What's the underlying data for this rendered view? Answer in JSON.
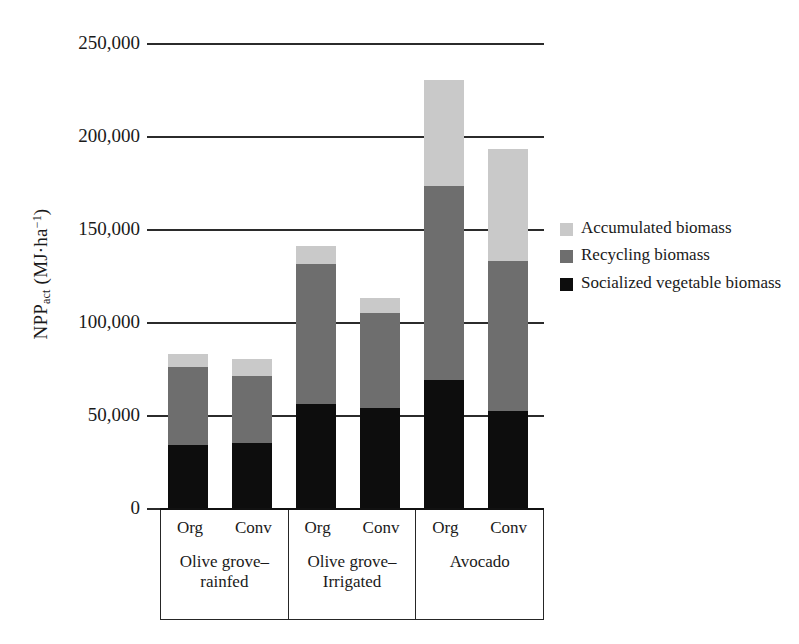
{
  "chart_data": {
    "type": "bar",
    "stacked": true,
    "title": "",
    "xlabel": "",
    "ylabel": "NPPact (MJ·ha-1)",
    "ylabel_parts": {
      "base": "NPP",
      "sub": "act",
      "unit_open": " (MJ·ha",
      "sup": "−1",
      "unit_close": ")"
    },
    "ylim": [
      0,
      250000
    ],
    "ytick_values": [
      0,
      50000,
      100000,
      150000,
      200000,
      250000
    ],
    "ytick_labels": [
      "0",
      "50,000",
      "100,000",
      "150,000",
      "200,000",
      "250,000"
    ],
    "grid": "horizontal-major",
    "legend_position": "right",
    "categories": [
      "Org",
      "Conv",
      "Org",
      "Conv",
      "Org",
      "Conv"
    ],
    "groups": [
      {
        "name": "Olive grove–rainfed",
        "line1": "Olive grove–",
        "line2": "rainfed",
        "subcategories": [
          "Org",
          "Conv"
        ]
      },
      {
        "name": "Olive grove–Irrigated",
        "line1": "Olive grove–",
        "line2": "Irrigated",
        "subcategories": [
          "Org",
          "Conv"
        ]
      },
      {
        "name": "Avocado",
        "line1": "Avocado",
        "line2": "",
        "subcategories": [
          "Org",
          "Conv"
        ]
      }
    ],
    "series": [
      {
        "name": "Socialized vegetable biomass",
        "color": "#0d0d0d",
        "values": [
          34000,
          35000,
          56000,
          54000,
          69000,
          52000
        ]
      },
      {
        "name": "Recycling biomass",
        "color": "#6e6e6e",
        "values": [
          42000,
          36000,
          75000,
          51000,
          104000,
          81000
        ]
      },
      {
        "name": "Accumulated biomass",
        "color": "#c9c9c9",
        "values": [
          7000,
          9000,
          10000,
          8000,
          57000,
          60000
        ]
      }
    ],
    "bar_totals": [
      83000,
      80000,
      141000,
      113000,
      230000,
      193000
    ],
    "legend": [
      {
        "label": "Accumulated biomass",
        "color": "#c9c9c9",
        "key": "acc"
      },
      {
        "label": "Recycling biomass",
        "color": "#6e6e6e",
        "key": "rec"
      },
      {
        "label": "Socialized vegetable biomass",
        "color": "#0d0d0d",
        "key": "soc"
      }
    ]
  }
}
